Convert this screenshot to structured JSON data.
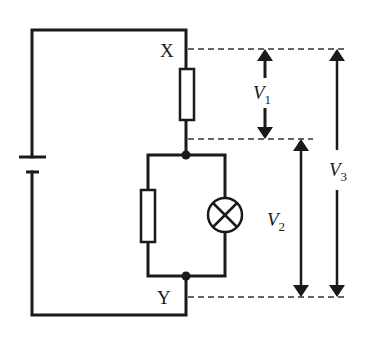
{
  "diagram": {
    "colors": {
      "wire": "#1a1a1a",
      "background": "#ffffff",
      "dash": "#333333"
    },
    "points": [
      {
        "id": "X",
        "label": "X"
      },
      {
        "id": "Y",
        "label": "Y"
      }
    ],
    "components": [
      {
        "id": "battery",
        "type": "cell"
      },
      {
        "id": "resistor-1",
        "type": "resistor",
        "between": "X and junction"
      },
      {
        "id": "resistor-2",
        "type": "resistor",
        "branch": "parallel-left"
      },
      {
        "id": "lamp",
        "type": "lamp",
        "branch": "parallel-right"
      }
    ],
    "voltages": {
      "v1": {
        "letter": "V",
        "sub": "1",
        "span": "X to junction"
      },
      "v2": {
        "letter": "V",
        "sub": "2",
        "span": "junction to Y"
      },
      "v3": {
        "letter": "V",
        "sub": "3",
        "span": "X to Y"
      }
    }
  }
}
